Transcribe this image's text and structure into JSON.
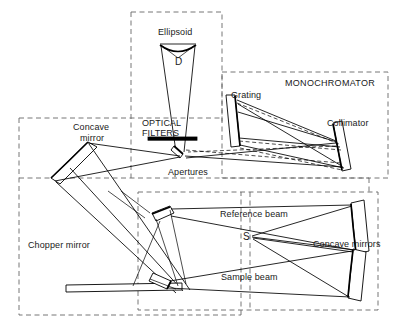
{
  "figure": {
    "width": 398,
    "height": 327,
    "line_color": "#000000",
    "dashed_color": "#555555",
    "background": "#ffffff"
  },
  "labels": {
    "ellipsoid": "Ellipsoid",
    "ellipsoid_angle": "D",
    "monochromator": "MONOCHROMATOR",
    "grating": "Grating",
    "collimator": "Collimator",
    "optical_filters_line1": "OPTICAL",
    "optical_filters_line2": "FILTERS",
    "concave_mirror_line1": "Concave",
    "concave_mirror_line2": "mirror",
    "apertures": "Apertures",
    "chopper_mirror": "Chopper mirror",
    "reference_beam": "Reference beam",
    "sample_beam": "Sample beam",
    "sample_point": "S",
    "concave_mirrors": "Concave mirrors"
  },
  "compartments": [
    {
      "name": "source-ellipsoid-compartment",
      "x": 131,
      "y": 12,
      "w": 91,
      "h": 113
    },
    {
      "name": "monochromator-compartment",
      "x": 222,
      "y": 72,
      "w": 166,
      "h": 106
    },
    {
      "name": "filters-apertures-compartment",
      "x": 19,
      "y": 118,
      "w": 350,
      "h": 60
    },
    {
      "name": "source-optics-compartment",
      "x": 19,
      "y": 118,
      "w": 222,
      "h": 197
    },
    {
      "name": "sample-compartment",
      "x": 138,
      "y": 192,
      "w": 240,
      "h": 118
    }
  ],
  "optical_elements": [
    {
      "name": "ellipsoid-mirror",
      "type": "curved-mirror"
    },
    {
      "name": "source-beam-cone",
      "type": "beam-cone"
    },
    {
      "name": "optical-filter-bar",
      "type": "filter"
    },
    {
      "name": "aperture-mirror",
      "type": "flat-mirror"
    },
    {
      "name": "entrance-concave-mirror",
      "type": "concave-mirror"
    },
    {
      "name": "grating-element",
      "type": "grating"
    },
    {
      "name": "collimator-mirror",
      "type": "flat-mirror"
    },
    {
      "name": "chopper-bar",
      "type": "chopper"
    },
    {
      "name": "chopper-mirror-upper",
      "type": "flat-mirror"
    },
    {
      "name": "chopper-mirror-lower",
      "type": "flat-mirror"
    },
    {
      "name": "concave-mirror-reference",
      "type": "concave-mirror"
    },
    {
      "name": "concave-mirror-sample",
      "type": "concave-mirror"
    }
  ],
  "beams": [
    {
      "name": "reference-beam-path",
      "label": "Reference beam"
    },
    {
      "name": "sample-beam-path",
      "label": "Sample beam"
    },
    {
      "name": "monochromator-ray-solid",
      "style": "solid"
    },
    {
      "name": "monochromator-ray-dashed",
      "style": "dashed"
    }
  ]
}
